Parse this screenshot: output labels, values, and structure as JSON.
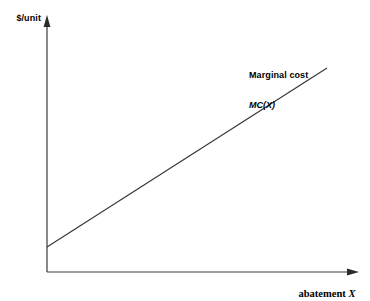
{
  "chart_data": {
    "type": "line",
    "title": "",
    "xlabel": "abatement",
    "xlabel_variable": "X",
    "ylabel": "$/unit",
    "grid": false,
    "legend_position": "inline-annotation",
    "axis_style": "arrow-headed open axes, no tick marks, no tick labels",
    "xlim": [
      0,
      1
    ],
    "ylim": [
      0,
      1
    ],
    "series": [
      {
        "name": "Marginal cost",
        "symbol": "MC(X)",
        "annotation_line1": "Marginal cost",
        "annotation_line2": "MC(X)",
        "color": "#333333",
        "x": [
          0,
          1
        ],
        "y": [
          0.098,
          0.8
        ],
        "intercept": 0.098,
        "slope": 0.702,
        "description": "upward sloping straight line with positive intercept"
      }
    ]
  },
  "figure": {
    "background": "#ffffff",
    "axis_color": "#3a3a3a",
    "line_color": "#333333",
    "y_axis_label": "$/unit",
    "x_axis_label_text": "abatement",
    "x_axis_label_var": "X",
    "annotation": {
      "line1": "Marginal cost",
      "line2": "MC(X)"
    }
  }
}
